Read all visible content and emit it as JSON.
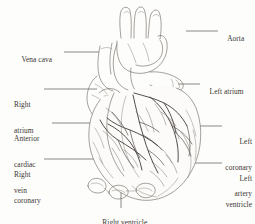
{
  "figure": {
    "kind": "anatomical-illustration",
    "style": "pen-and-ink line drawing, monochrome",
    "background_color": "#fdfdfb",
    "ink_color": "#4a4541",
    "leader_color": "#5c5753",
    "width": 255,
    "height": 224
  },
  "labels": {
    "left": [
      {
        "id": "vena-cava",
        "text": "Vena cava",
        "lines": [
          "Vena cava"
        ]
      },
      {
        "id": "right-atrium",
        "text": "Right atrium",
        "lines": [
          "Right",
          "atrium"
        ]
      },
      {
        "id": "anterior-cardiac-vein",
        "text": "Anterior cardiac vein",
        "lines": [
          "Anterior",
          "cardiac",
          "vein"
        ]
      },
      {
        "id": "right-coronary-artery",
        "text": "Right coronary artery",
        "lines": [
          "Right",
          "coronary",
          "artery"
        ]
      }
    ],
    "right": [
      {
        "id": "aorta",
        "text": "Aorta",
        "lines": [
          "Aorta"
        ]
      },
      {
        "id": "left-atrium",
        "text": "Left atrium",
        "lines": [
          "Left atrium"
        ]
      },
      {
        "id": "left-coronary-artery",
        "text": "Left coronary artery",
        "lines": [
          "Left",
          "coronary",
          "artery"
        ]
      },
      {
        "id": "left-ventricle",
        "text": "Left ventricle",
        "lines": [
          "Left",
          "ventricle"
        ]
      }
    ],
    "bottom": [
      {
        "id": "right-ventricle",
        "text": "Right ventricle",
        "lines": [
          "Right ventricle"
        ]
      }
    ]
  },
  "label_text": {
    "vena_cava": "Vena cava",
    "right_l1": "Right",
    "right_l2": "atrium",
    "ant_l1": "Anterior",
    "ant_l2": "cardiac",
    "ant_l3": "vein",
    "rca_l1": "Right",
    "rca_l2": "coronary",
    "rca_l3": "artery",
    "aorta": "Aorta",
    "left_atrium": "Left atrium",
    "lca_l1": "Left",
    "lca_l2": "coronary",
    "lca_l3": "artery",
    "lv_l1": "Left",
    "lv_l2": "ventricle",
    "right_ventricle": "Right ventricle"
  }
}
